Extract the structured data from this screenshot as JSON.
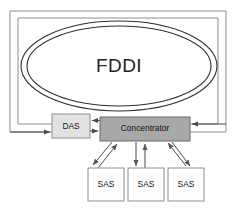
{
  "diagram": {
    "ring": {
      "label": "FDDI",
      "shape": "dual-counter-rotating-ring",
      "outer_ring_shape": "rectangle",
      "inner_ring_shape": "ellipse",
      "ring_count": 2,
      "stroke_color": "#2e2e2e",
      "outer_stroke_color": "#8d8d8d"
    },
    "nodes": [
      {
        "id": "das",
        "label": "DAS",
        "type": "dual-attachment-station",
        "fill_color": "#e2e2e2",
        "border_color": "#909090"
      },
      {
        "id": "concentrator",
        "label": "Concentrator",
        "type": "concentrator",
        "fill_color": "#a8a8a8",
        "border_color": "#6b6b6b"
      },
      {
        "id": "sas-1",
        "label": "SAS",
        "type": "single-attachment-station",
        "fill_color": "#fdfdfd",
        "border_color": "#8f8f8f"
      },
      {
        "id": "sas-2",
        "label": "SAS",
        "type": "single-attachment-station",
        "fill_color": "#fdfdfd",
        "border_color": "#8f8f8f"
      },
      {
        "id": "sas-3",
        "label": "SAS",
        "type": "single-attachment-station",
        "fill_color": "#fdfdfd",
        "border_color": "#8f8f8f"
      }
    ],
    "connections": [
      {
        "from": "ring",
        "to": "das",
        "direction": "into-das",
        "arrow": true
      },
      {
        "from": "das",
        "to": "concentrator",
        "direction": "right",
        "arrow": true
      },
      {
        "from": "concentrator",
        "to": "das",
        "direction": "left",
        "arrow": true
      },
      {
        "from": "ring",
        "to": "concentrator",
        "direction": "into-concentrator",
        "arrow": true
      },
      {
        "from": "concentrator",
        "to": "sas-1",
        "direction": "down",
        "arrow": true
      },
      {
        "from": "sas-1",
        "to": "concentrator",
        "direction": "up",
        "arrow": true
      },
      {
        "from": "concentrator",
        "to": "sas-2",
        "direction": "down",
        "arrow": true
      },
      {
        "from": "sas-2",
        "to": "concentrator",
        "direction": "up",
        "arrow": true
      },
      {
        "from": "concentrator",
        "to": "sas-3",
        "direction": "down",
        "arrow": true
      },
      {
        "from": "sas-3",
        "to": "concentrator",
        "direction": "up",
        "arrow": true
      }
    ]
  }
}
